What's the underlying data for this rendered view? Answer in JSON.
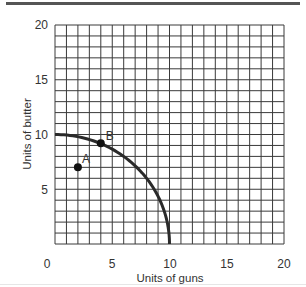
{
  "chart_data": {
    "type": "line",
    "title": "",
    "xlabel": "Units of guns",
    "ylabel": "Units of butter",
    "xlim": [
      0,
      20
    ],
    "ylim": [
      0,
      20
    ],
    "grid": true,
    "grid_step": 1,
    "x_ticks": [
      "0",
      "5",
      "10",
      "15",
      "20"
    ],
    "y_ticks": [
      "5",
      "10",
      "15",
      "20"
    ],
    "series": [
      {
        "name": "Production possibilities frontier",
        "shape": "concave quarter-circle",
        "points": [
          [
            0,
            10
          ],
          [
            2,
            9.8
          ],
          [
            4,
            9.2
          ],
          [
            6,
            8.0
          ],
          [
            8,
            6.0
          ],
          [
            9,
            4.4
          ],
          [
            10,
            0
          ]
        ]
      }
    ],
    "points": [
      {
        "label": "A",
        "x": 2,
        "y": 7
      },
      {
        "label": "B",
        "x": 4,
        "y": 9.2
      }
    ],
    "legend": null
  },
  "labels": {
    "x_axis": "Units of guns",
    "y_axis": "Units of butter",
    "point_a": "A",
    "point_b": "B",
    "x0": "0",
    "x5": "5",
    "x10": "10",
    "x15": "15",
    "x20": "20",
    "y5": "5",
    "y10": "10",
    "y15": "15",
    "y20": "20"
  }
}
